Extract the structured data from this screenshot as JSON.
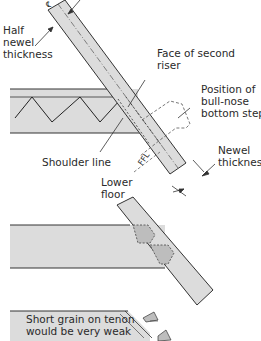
{
  "diagram": {
    "type": "technical-joinery",
    "colors": {
      "fill": "#dcdcdc",
      "tenon_fill": "#bdbdbd",
      "stroke": "#333333",
      "background": "#ffffff"
    },
    "labels": {
      "centre_line": "℄",
      "half_newel_line1": "Half",
      "half_newel_line2": "newel",
      "half_newel_line3": "thickness",
      "face_riser_line1": "Face of second",
      "face_riser_line2": "riser",
      "bullnose_line1": "Position of",
      "bullnose_line2": "bull-nose",
      "bullnose_line3": "bottom step",
      "shoulder": "Shoulder line",
      "ffl": "FFL",
      "newel_thick_line1": "Newel",
      "newel_thick_line2": "thickness",
      "lower_floor_line1": "Lower",
      "lower_floor_line2": "floor",
      "short_grain_line1": "Short grain on tenon",
      "short_grain_line2": "would be very weak"
    }
  }
}
